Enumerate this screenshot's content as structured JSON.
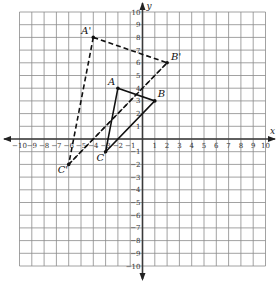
{
  "figure": {
    "x_axis_label": "x",
    "y_axis_label": "y",
    "x_range": [
      -10,
      10
    ],
    "y_range": [
      -10,
      10
    ],
    "x_ticks": [
      "-10",
      "-9",
      "-8",
      "-7",
      "-6",
      "-5",
      "-4",
      "-3",
      "-2",
      "-1",
      "1",
      "2",
      "3",
      "4",
      "5",
      "6",
      "7",
      "8",
      "9",
      "10"
    ],
    "y_ticks": [
      "10",
      "9",
      "8",
      "7",
      "6",
      "5",
      "4",
      "3",
      "2",
      "1",
      "-1",
      "-2",
      "-3",
      "-4",
      "-5",
      "-6",
      "-7",
      "-8",
      "-9",
      "-10"
    ],
    "grid": true,
    "colors": {
      "grid": "#8a8a8a",
      "axis": "#3a3a3a",
      "shape": "#111111"
    }
  },
  "triangles": [
    {
      "name": "ABC",
      "style": "solid",
      "vertices": [
        {
          "label": "A",
          "x": -2,
          "y": 4
        },
        {
          "label": "B",
          "x": 1,
          "y": 3
        },
        {
          "label": "C",
          "x": -3,
          "y": -1
        }
      ]
    },
    {
      "name": "A'B'C'",
      "style": "dashed",
      "vertices": [
        {
          "label": "A'",
          "x": -4,
          "y": 8
        },
        {
          "label": "B'",
          "x": 2,
          "y": 6
        },
        {
          "label": "C'",
          "x": -6,
          "y": -2
        }
      ]
    }
  ],
  "guide_lines": [
    {
      "from": {
        "x": -6,
        "y": -2
      },
      "to": {
        "x": 2,
        "y": 6
      },
      "style": "dashed"
    }
  ]
}
